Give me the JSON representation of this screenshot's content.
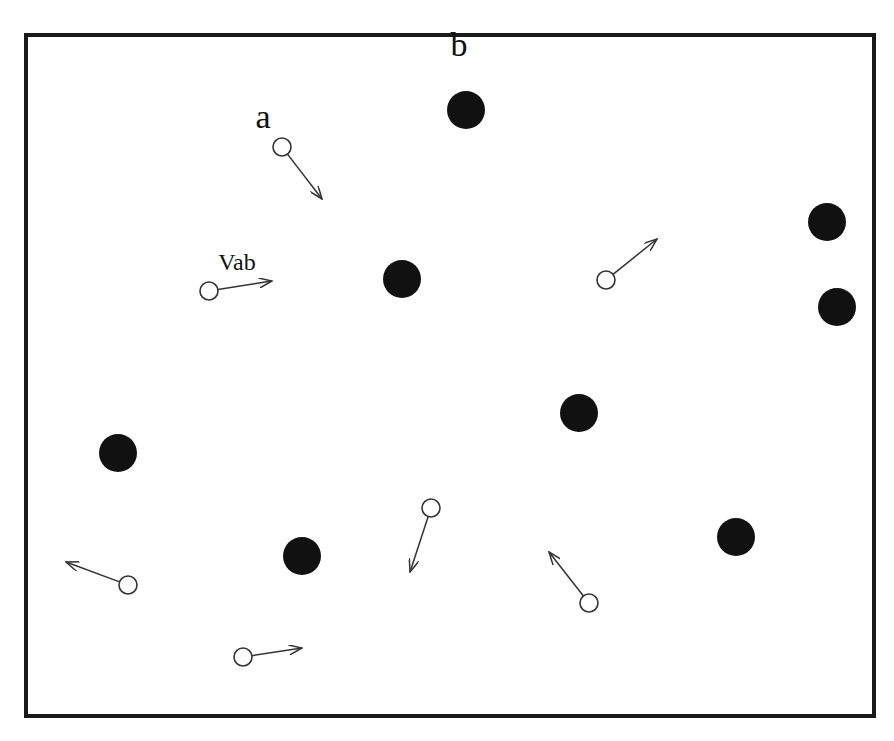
{
  "figure": {
    "frame": {
      "x": 26,
      "y": 35,
      "width": 848,
      "height": 681
    },
    "labels": [
      {
        "id": "a",
        "text": "a",
        "x": 263,
        "y": 128,
        "size": 34
      },
      {
        "id": "b",
        "text": "b",
        "x": 459,
        "y": 56,
        "size": 34
      },
      {
        "id": "vab",
        "text": "Vab",
        "x": 237,
        "y": 270,
        "size": 24
      }
    ],
    "solid_particles": [
      {
        "x": 466,
        "y": 110,
        "r": 19
      },
      {
        "x": 827,
        "y": 222,
        "r": 19
      },
      {
        "x": 402,
        "y": 279,
        "r": 19
      },
      {
        "x": 837,
        "y": 307,
        "r": 19
      },
      {
        "x": 579,
        "y": 413,
        "r": 19
      },
      {
        "x": 118,
        "y": 453,
        "r": 19
      },
      {
        "x": 736,
        "y": 537,
        "r": 19
      },
      {
        "x": 302,
        "y": 556,
        "r": 19
      }
    ],
    "hollow_particles": [
      {
        "id": "a",
        "x": 282,
        "y": 147,
        "r": 9,
        "arrow_to": [
          322,
          199
        ]
      },
      {
        "id": "vab-particle",
        "x": 209,
        "y": 291,
        "r": 9,
        "arrow_to": [
          272,
          281
        ]
      },
      {
        "x": 606,
        "y": 280,
        "r": 9,
        "arrow_to": [
          657,
          239
        ]
      },
      {
        "x": 431,
        "y": 508,
        "r": 9,
        "arrow_to": [
          410,
          572
        ]
      },
      {
        "x": 128,
        "y": 585,
        "r": 9,
        "arrow_to": [
          66,
          562
        ]
      },
      {
        "x": 589,
        "y": 603,
        "r": 9,
        "arrow_to": [
          549,
          552
        ]
      },
      {
        "x": 243,
        "y": 657,
        "r": 9,
        "arrow_to": [
          302,
          648
        ]
      }
    ]
  }
}
